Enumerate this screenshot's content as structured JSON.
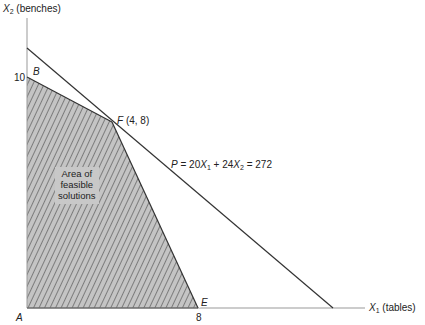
{
  "axes": {
    "y_label_var": "X",
    "y_label_sub": "2",
    "y_label_text": "(benches)",
    "x_label_var": "X",
    "x_label_sub": "1",
    "x_label_text": "(tables)",
    "y_tick": "10",
    "x_tick": "8"
  },
  "points": {
    "A": "A",
    "B": "B",
    "E": "E",
    "F": "F",
    "F_coords": "(4, 8)"
  },
  "region_label": {
    "line1": "Area of",
    "line2": "feasible",
    "line3": "solutions"
  },
  "profit_line": {
    "label_P": "P",
    "label_eq1": " = 20",
    "var1": "X",
    "sub1": "1",
    "label_eq2": " + 24",
    "var2": "X",
    "sub2": "2",
    "label_eq3": " = 272"
  },
  "colors": {
    "hatch_bg": "#c4c4c4",
    "hatch_line": "#555555",
    "axis": "#999999",
    "line": "#333333"
  }
}
